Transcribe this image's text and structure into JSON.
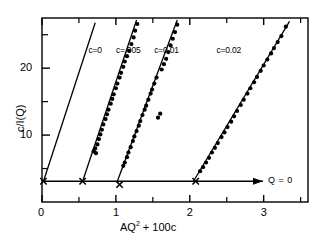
{
  "figure": {
    "background": "#ffffff",
    "ink": "#000000",
    "frame": {
      "left": 42,
      "right": 308,
      "top": 18,
      "bottom": 202
    }
  },
  "chart_data": {
    "type": "scatter",
    "title": "",
    "xlabel": "AQ² + 100c",
    "ylabel": "c/I(Q)",
    "xlim": [
      0,
      3.6
    ],
    "ylim": [
      0,
      27.5
    ],
    "grid": false,
    "legend": "inline-labels",
    "xticks": [
      0,
      1,
      2,
      3
    ],
    "xtick_labels": [
      "0",
      "1",
      "2",
      "3"
    ],
    "xminor": [
      0.5,
      1.5,
      2.5,
      3.5
    ],
    "yticks": [
      10,
      20
    ],
    "ytick_labels": [
      "10",
      "20"
    ],
    "yminor": [
      5,
      15,
      25
    ],
    "baseline_annotation": {
      "label": "Q = 0",
      "y_value": 3.1
    },
    "series": [
      {
        "name": "c=0",
        "label": "c=0",
        "label_x": 0.63,
        "label_y": 23.4,
        "intercept_marker": {
          "x": 0.02,
          "y": 3.1,
          "symbol": "x"
        },
        "fit_line": {
          "x0": 0.02,
          "y0": 3.1,
          "x1": 0.72,
          "y1": 26.8
        },
        "points": []
      },
      {
        "name": "c=.005",
        "label": "c=.005",
        "label_x": 1.0,
        "label_y": 23.4,
        "intercept_marker": {
          "x": 0.55,
          "y": 3.1,
          "symbol": "x"
        },
        "fit_line": {
          "x0": 0.55,
          "y0": 3.1,
          "x1": 1.28,
          "y1": 27.2
        },
        "points": [
          {
            "x": 0.7,
            "y": 7.6
          },
          {
            "x": 0.72,
            "y": 8.0
          },
          {
            "x": 0.73,
            "y": 7.3
          },
          {
            "x": 0.75,
            "y": 8.6
          },
          {
            "x": 0.77,
            "y": 9.4
          },
          {
            "x": 0.79,
            "y": 10.1
          },
          {
            "x": 0.81,
            "y": 10.8
          },
          {
            "x": 0.83,
            "y": 11.6
          },
          {
            "x": 0.86,
            "y": 12.4
          },
          {
            "x": 0.88,
            "y": 13.1
          },
          {
            "x": 0.9,
            "y": 13.8
          },
          {
            "x": 0.93,
            "y": 14.7
          },
          {
            "x": 0.95,
            "y": 15.4
          },
          {
            "x": 0.97,
            "y": 16.1
          },
          {
            "x": 1.0,
            "y": 17.0
          },
          {
            "x": 1.02,
            "y": 17.7
          },
          {
            "x": 1.05,
            "y": 18.6
          },
          {
            "x": 1.07,
            "y": 19.3
          },
          {
            "x": 1.1,
            "y": 20.2
          },
          {
            "x": 1.12,
            "y": 21.0
          },
          {
            "x": 1.15,
            "y": 21.8
          },
          {
            "x": 1.18,
            "y": 22.6
          },
          {
            "x": 1.21,
            "y": 23.6
          },
          {
            "x": 1.24,
            "y": 24.6
          },
          {
            "x": 1.26,
            "y": 25.6
          },
          {
            "x": 1.29,
            "y": 26.6
          }
        ]
      },
      {
        "name": "c=0.01",
        "label": "c=0.01",
        "label_x": 1.52,
        "label_y": 23.4,
        "intercept_marker": {
          "x": 1.05,
          "y": 2.6,
          "symbol": "x"
        },
        "fit_line": {
          "x0": 1.02,
          "y0": 3.1,
          "x1": 1.83,
          "y1": 27.2
        },
        "points": [
          {
            "x": 1.1,
            "y": 5.4
          },
          {
            "x": 1.12,
            "y": 5.9
          },
          {
            "x": 1.15,
            "y": 6.7
          },
          {
            "x": 1.17,
            "y": 7.4
          },
          {
            "x": 1.2,
            "y": 8.2
          },
          {
            "x": 1.23,
            "y": 9.1
          },
          {
            "x": 1.25,
            "y": 9.8
          },
          {
            "x": 1.28,
            "y": 10.6
          },
          {
            "x": 1.31,
            "y": 11.4
          },
          {
            "x": 1.33,
            "y": 12.1
          },
          {
            "x": 1.36,
            "y": 13.0
          },
          {
            "x": 1.39,
            "y": 13.8
          },
          {
            "x": 1.41,
            "y": 14.4
          },
          {
            "x": 1.44,
            "y": 15.3
          },
          {
            "x": 1.47,
            "y": 16.2
          },
          {
            "x": 1.49,
            "y": 16.8
          },
          {
            "x": 1.52,
            "y": 17.7
          },
          {
            "x": 1.55,
            "y": 18.6
          },
          {
            "x": 1.57,
            "y": 12.6
          },
          {
            "x": 1.6,
            "y": 13.2
          },
          {
            "x": 1.62,
            "y": 19.8
          },
          {
            "x": 1.65,
            "y": 20.6
          },
          {
            "x": 1.68,
            "y": 21.4
          },
          {
            "x": 1.71,
            "y": 22.4
          },
          {
            "x": 1.74,
            "y": 23.4
          },
          {
            "x": 1.77,
            "y": 24.4
          },
          {
            "x": 1.8,
            "y": 25.4
          },
          {
            "x": 1.83,
            "y": 26.5
          }
        ]
      },
      {
        "name": "c=0.02",
        "label": "c=0.02",
        "label_x": 2.36,
        "label_y": 23.4,
        "intercept_marker": {
          "x": 2.08,
          "y": 3.1,
          "symbol": "x"
        },
        "fit_line": {
          "x0": 2.05,
          "y0": 3.1,
          "x1": 3.35,
          "y1": 27.0
        },
        "points": [
          {
            "x": 2.14,
            "y": 4.6
          },
          {
            "x": 2.18,
            "y": 5.2
          },
          {
            "x": 2.22,
            "y": 5.9
          },
          {
            "x": 2.26,
            "y": 6.6
          },
          {
            "x": 2.3,
            "y": 7.4
          },
          {
            "x": 2.34,
            "y": 8.1
          },
          {
            "x": 2.38,
            "y": 8.8
          },
          {
            "x": 2.43,
            "y": 9.7
          },
          {
            "x": 2.47,
            "y": 10.4
          },
          {
            "x": 2.51,
            "y": 11.2
          },
          {
            "x": 2.56,
            "y": 12.0
          },
          {
            "x": 2.6,
            "y": 12.8
          },
          {
            "x": 2.64,
            "y": 13.6
          },
          {
            "x": 2.69,
            "y": 14.5
          },
          {
            "x": 2.73,
            "y": 15.3
          },
          {
            "x": 2.78,
            "y": 16.2
          },
          {
            "x": 2.82,
            "y": 17.0
          },
          {
            "x": 2.87,
            "y": 17.9
          },
          {
            "x": 2.91,
            "y": 18.7
          },
          {
            "x": 2.96,
            "y": 19.6
          },
          {
            "x": 3.0,
            "y": 20.4
          },
          {
            "x": 3.05,
            "y": 21.3
          },
          {
            "x": 3.1,
            "y": 22.2
          },
          {
            "x": 3.14,
            "y": 23.0
          },
          {
            "x": 3.19,
            "y": 23.9
          },
          {
            "x": 3.24,
            "y": 24.8
          },
          {
            "x": 3.3,
            "y": 26.2
          }
        ]
      }
    ]
  }
}
